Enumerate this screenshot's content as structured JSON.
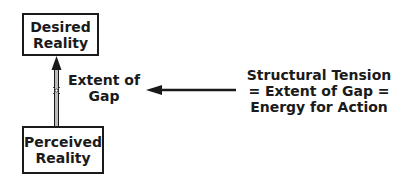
{
  "nodes": {
    "desired": {
      "line1": "Desired",
      "line2": "Reality"
    },
    "perceived": {
      "line1": "Perceived",
      "line2": "Reality"
    }
  },
  "flow_label": {
    "line1": "Extent of",
    "line2": "Gap"
  },
  "annotation": {
    "line1": "Structural Tension",
    "line2": "= Extent of Gap =",
    "line3": "Energy for Action"
  },
  "colors": {
    "stroke": "#1a1a1a",
    "pipe": "#999999"
  }
}
